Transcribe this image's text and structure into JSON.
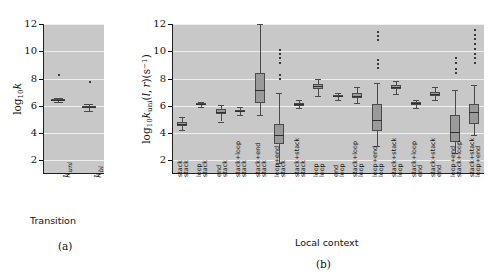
{
  "figure": {
    "panel_a_label": "(a)",
    "panel_b_label": "(b)"
  },
  "chart_data": [
    {
      "id": "panel_a",
      "type": "box",
      "title": "",
      "xlabel": "Transition",
      "ylabel": "log10 k",
      "ylabel_parts": {
        "base": "log",
        "sub": "10",
        "sym": "k"
      },
      "ylim": [
        1,
        12
      ],
      "yticks": [
        2,
        4,
        6,
        8,
        10,
        12
      ],
      "grid": true,
      "grid_color": "#efefef",
      "plot_bg": "#c8c8c8",
      "box_fill": "#9a9a9a",
      "box_edge": "#4a4a4a",
      "categories": [
        "k_uni",
        "k_bi"
      ],
      "category_labels": [
        "k",
        "k"
      ],
      "category_subs": [
        "uni",
        "bi"
      ],
      "boxes": [
        {
          "name": "k_uni",
          "min": 6.3,
          "q1": 6.36,
          "med": 6.42,
          "q3": 6.48,
          "max": 6.54,
          "outliers": [
            8.35
          ]
        },
        {
          "name": "k_bi",
          "min": 5.65,
          "q1": 5.82,
          "med": 5.9,
          "q3": 6.0,
          "max": 6.15,
          "outliers": [
            7.8
          ]
        }
      ]
    },
    {
      "id": "panel_b",
      "type": "box",
      "title": "",
      "xlabel": "Local context",
      "ylabel": "log10 k_uni(l,r)(s^-1)",
      "ylabel_parts": {
        "base": "log",
        "sub": "10",
        "sym": "k",
        "symsub": "uni",
        "args": "(l, r)",
        "units": "(s",
        "unitsup": "-1",
        "unitend": ")"
      },
      "ylim": [
        1,
        12
      ],
      "yticks": [
        2,
        4,
        6,
        8,
        10,
        12
      ],
      "grid": true,
      "grid_color": "#efefef",
      "plot_bg": "#c8c8c8",
      "box_fill": "#9a9a9a",
      "box_edge": "#4a4a4a",
      "categories": [
        "stack / stack",
        "loop / stack",
        "end / stack",
        "stack+loop / stack",
        "stack+end / stack",
        "loop+end / stack",
        "stack+stack / stack",
        "loop / loop",
        "end / loop",
        "stack+loop / loop",
        "loop+end / loop",
        "stack+stack / loop",
        "stack+loop / end",
        "stack+stack / end",
        "loop+end / stack+loop",
        "stack+stack / loop+end"
      ],
      "category_lines": [
        [
          "stack",
          "stack"
        ],
        [
          "loop",
          "stack"
        ],
        [
          "end",
          "stack"
        ],
        [
          "stack+loop",
          "stack"
        ],
        [
          "stack+end",
          "stack"
        ],
        [
          "loop+end",
          "stack"
        ],
        [
          "stack+stack",
          "stack"
        ],
        [
          "loop",
          "loop"
        ],
        [
          "end",
          "loop"
        ],
        [
          "stack+loop",
          "loop"
        ],
        [
          "loop+end",
          "loop"
        ],
        [
          "stack+stack",
          "loop"
        ],
        [
          "stack+loop",
          "end"
        ],
        [
          "stack+stack",
          "end"
        ],
        [
          "loop+end",
          "stack+loop"
        ],
        [
          "stack+stack",
          "loop+end"
        ]
      ],
      "boxes": [
        {
          "name": "stack/stack",
          "min": 4.2,
          "q1": 4.52,
          "med": 4.68,
          "q3": 4.84,
          "max": 5.15,
          "outliers": []
        },
        {
          "name": "loop/stack",
          "min": 5.95,
          "q1": 6.05,
          "med": 6.12,
          "q3": 6.18,
          "max": 6.28,
          "outliers": []
        },
        {
          "name": "end/stack",
          "min": 4.85,
          "q1": 5.38,
          "med": 5.56,
          "q3": 5.76,
          "max": 6.05,
          "outliers": []
        },
        {
          "name": "stack+loop/stack",
          "min": 5.3,
          "q1": 5.54,
          "med": 5.62,
          "q3": 5.72,
          "max": 5.95,
          "outliers": []
        },
        {
          "name": "stack+end/stack",
          "min": 5.35,
          "q1": 6.2,
          "med": 7.15,
          "q3": 8.38,
          "max": 12.0,
          "outliers": []
        },
        {
          "name": "loop+end/stack",
          "min": 1.8,
          "q1": 3.2,
          "med": 3.85,
          "q3": 4.65,
          "max": 6.95,
          "outliers": [
            10.2,
            9.85,
            9.55,
            9.25,
            8.35,
            8.05
          ]
        },
        {
          "name": "stack+stack/stack",
          "min": 5.85,
          "q1": 6.02,
          "med": 6.1,
          "q3": 6.22,
          "max": 6.45,
          "outliers": []
        },
        {
          "name": "loop/loop",
          "min": 6.7,
          "q1": 7.2,
          "med": 7.42,
          "q3": 7.62,
          "max": 7.98,
          "outliers": []
        },
        {
          "name": "end/loop",
          "min": 6.45,
          "q1": 6.62,
          "med": 6.7,
          "q3": 6.8,
          "max": 6.92,
          "outliers": []
        },
        {
          "name": "stack+loop/loop",
          "min": 6.2,
          "q1": 6.6,
          "med": 6.75,
          "q3": 6.92,
          "max": 7.35,
          "outliers": []
        },
        {
          "name": "loop+end/loop",
          "min": 3.05,
          "q1": 4.15,
          "med": 4.95,
          "q3": 6.1,
          "max": 7.7,
          "outliers": [
            11.5,
            11.2,
            10.9,
            9.45,
            9.15,
            8.85
          ]
        },
        {
          "name": "stack+stack/loop",
          "min": 6.9,
          "q1": 7.2,
          "med": 7.35,
          "q3": 7.55,
          "max": 7.85,
          "outliers": []
        },
        {
          "name": "stack+loop/end",
          "min": 5.85,
          "q1": 6.08,
          "med": 6.18,
          "q3": 6.28,
          "max": 6.45,
          "outliers": []
        },
        {
          "name": "stack+stack/end",
          "min": 6.45,
          "q1": 6.72,
          "med": 6.85,
          "q3": 7.0,
          "max": 7.35,
          "outliers": []
        },
        {
          "name": "loop+end/stack+loop",
          "min": 2.55,
          "q1": 3.35,
          "med": 4.05,
          "q3": 5.3,
          "max": 7.15,
          "outliers": [
            9.55,
            9.2,
            8.8,
            8.45
          ]
        },
        {
          "name": "stack+stack/loop+end",
          "min": 3.85,
          "q1": 4.7,
          "med": 5.55,
          "q3": 6.15,
          "max": 7.55,
          "outliers": [
            11.6,
            11.3,
            10.95,
            10.6,
            10.25,
            9.9,
            9.55,
            9.2
          ]
        }
      ]
    }
  ]
}
